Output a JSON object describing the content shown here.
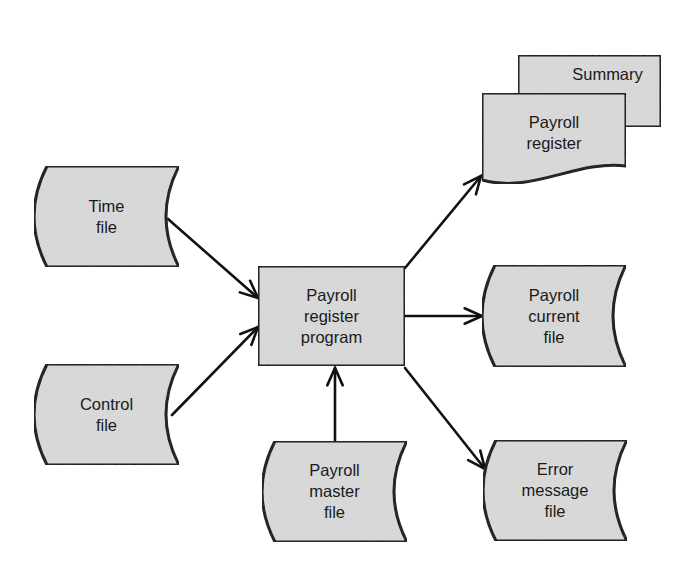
{
  "diagram": {
    "type": "system-flowchart",
    "colors": {
      "fill": "#d9d9d9",
      "stroke": "#111111",
      "background": "#ffffff",
      "text": "#1a1a1a"
    },
    "nodes": [
      {
        "id": "time-file",
        "shape": "stored-data",
        "label_lines": [
          "Time",
          "file"
        ],
        "box": {
          "x": 34,
          "y": 166,
          "w": 145,
          "h": 101
        }
      },
      {
        "id": "control-file",
        "shape": "stored-data",
        "label_lines": [
          "Control",
          "file"
        ],
        "box": {
          "x": 34,
          "y": 364,
          "w": 145,
          "h": 101
        }
      },
      {
        "id": "payroll-register-program",
        "shape": "process",
        "label_lines": [
          "Payroll",
          "register",
          "program"
        ],
        "box": {
          "x": 258,
          "y": 266,
          "w": 147,
          "h": 100
        }
      },
      {
        "id": "payroll-master-file",
        "shape": "stored-data",
        "label_lines": [
          "Payroll",
          "master",
          "file"
        ],
        "box": {
          "x": 262,
          "y": 441,
          "w": 145,
          "h": 101
        }
      },
      {
        "id": "summary",
        "shape": "document-back",
        "label_lines": [
          "Summary"
        ],
        "box": {
          "x": 518,
          "y": 55,
          "w": 143,
          "h": 72
        }
      },
      {
        "id": "payroll-register",
        "shape": "document",
        "label_lines": [
          "Payroll",
          "register"
        ],
        "box": {
          "x": 482,
          "y": 93,
          "w": 144,
          "h": 97
        }
      },
      {
        "id": "payroll-current-file",
        "shape": "stored-data",
        "label_lines": [
          "Payroll",
          "current",
          "file"
        ],
        "box": {
          "x": 482,
          "y": 265,
          "w": 144,
          "h": 102
        }
      },
      {
        "id": "error-message-file",
        "shape": "stored-data",
        "label_lines": [
          "Error",
          "message",
          "file"
        ],
        "box": {
          "x": 483,
          "y": 440,
          "w": 144,
          "h": 101
        }
      }
    ],
    "edges": [
      {
        "from": "time-file",
        "to": "payroll-register-program",
        "x1": 168,
        "y1": 219,
        "x2": 258,
        "y2": 298
      },
      {
        "from": "control-file",
        "to": "payroll-register-program",
        "x1": 172,
        "y1": 415,
        "x2": 258,
        "y2": 327
      },
      {
        "from": "payroll-master-file",
        "to": "payroll-register-program",
        "x1": 335,
        "y1": 442,
        "x2": 335,
        "y2": 368
      },
      {
        "from": "payroll-register-program",
        "to": "payroll-register",
        "x1": 405,
        "y1": 268,
        "x2": 481,
        "y2": 176
      },
      {
        "from": "payroll-register-program",
        "to": "payroll-current-file",
        "x1": 405,
        "y1": 316,
        "x2": 482,
        "y2": 316
      },
      {
        "from": "payroll-register-program",
        "to": "error-message-file",
        "x1": 405,
        "y1": 368,
        "x2": 485,
        "y2": 469
      }
    ]
  }
}
